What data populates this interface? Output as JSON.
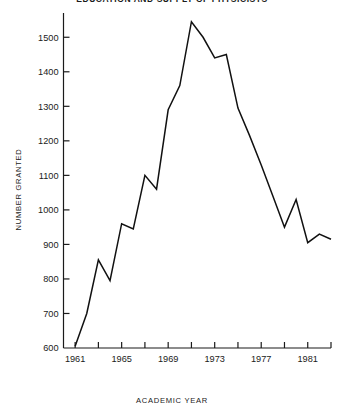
{
  "chart_data": {
    "type": "line",
    "title": "EDUCATION AND SUPPLY OF PHYSICISTS",
    "xlabel": "ACADEMIC YEAR",
    "ylabel": "NUMBER GRANTED",
    "xlim": [
      1960,
      1983
    ],
    "ylim": [
      600,
      1550
    ],
    "ytick_labels": [
      "600",
      "700",
      "800",
      "900",
      "1000",
      "1100",
      "1200",
      "1300",
      "1400",
      "1500"
    ],
    "ytick_values": [
      600,
      700,
      800,
      900,
      1000,
      1100,
      1200,
      1300,
      1400,
      1500
    ],
    "xtick_values": [
      1961,
      1963,
      1965,
      1967,
      1969,
      1971,
      1973,
      1975,
      1977,
      1979,
      1981,
      1983
    ],
    "xtick_labels": [
      "1961",
      "",
      "1965",
      "",
      "1969",
      "",
      "1973",
      "",
      "1977",
      "",
      "1981",
      ""
    ],
    "xtick_labeled": [
      "1961",
      "1965",
      "1969",
      "1973",
      "1977",
      "1981"
    ],
    "grid": false,
    "legend": "none",
    "line_color": "#111111",
    "x": [
      1961,
      1962,
      1963,
      1964,
      1965,
      1966,
      1967,
      1968,
      1969,
      1970,
      1971,
      1972,
      1973,
      1974,
      1975,
      1976,
      1977,
      1978,
      1979,
      1980,
      1981,
      1982,
      1983
    ],
    "values": [
      605,
      700,
      855,
      795,
      960,
      945,
      1100,
      1060,
      1290,
      1360,
      1545,
      1500,
      1440,
      1450,
      1295,
      1215,
      1130,
      1040,
      950,
      1030,
      905,
      930,
      915
    ],
    "series": [
      {
        "name": "Number granted",
        "values": [
          605,
          700,
          855,
          795,
          960,
          945,
          1100,
          1060,
          1290,
          1360,
          1545,
          1500,
          1440,
          1450,
          1295,
          1215,
          1130,
          1040,
          950,
          1030,
          905,
          930,
          915
        ]
      }
    ]
  },
  "axis": {
    "y_title": "NUMBER GRANTED",
    "x_title": "ACADEMIC YEAR"
  },
  "header": {
    "title": "EDUCATION AND SUPPLY OF PHYSICISTS"
  }
}
